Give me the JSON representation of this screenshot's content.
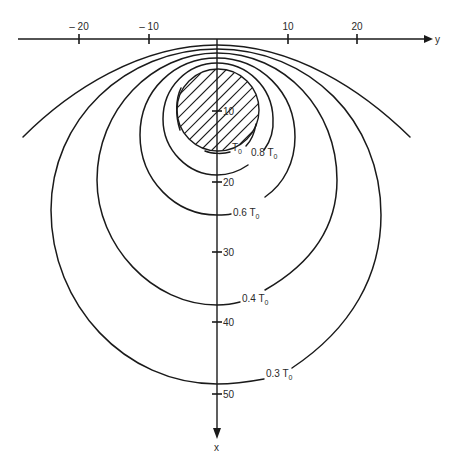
{
  "figure": {
    "stroke_color": "#1a1a1a",
    "background": "#ffffff"
  },
  "chart_data": {
    "type": "contour",
    "title": "",
    "xlabel": "x",
    "ylabel": "y",
    "y_axis_horizontal": {
      "name": "y",
      "ticks": [
        -20,
        -10,
        10,
        20
      ],
      "tick_labels": [
        "– 20",
        "– 10",
        "10",
        "20"
      ],
      "range": [
        -28,
        31
      ]
    },
    "x_axis_vertical": {
      "name": "x",
      "direction": "downward",
      "ticks": [
        10,
        20,
        30,
        40,
        50
      ],
      "tick_labels": [
        "10",
        "20",
        "30",
        "40",
        "50"
      ],
      "range": [
        0,
        58
      ]
    },
    "source": {
      "shape": "circle",
      "hatched": true,
      "center_x": 10,
      "center_y": 0,
      "radius": 6
    },
    "contours": [
      {
        "label": "T₀",
        "value": 1.0,
        "bottom_x": 6.2,
        "half_width": 6.1
      },
      {
        "label": "0.8 T₀",
        "value": 0.8,
        "bottom_x": 19.1,
        "half_width": 7.9
      },
      {
        "label": "0.6 T₀",
        "value": 0.6,
        "bottom_x": 24.8,
        "half_width": 11.0
      },
      {
        "label": "0.4 T₀",
        "value": 0.4,
        "bottom_x": 37.5,
        "half_width": 17.0
      },
      {
        "label": "0.3 T₀",
        "value": 0.3,
        "bottom_x": 48.9,
        "half_width": 23.5
      },
      {
        "label": "",
        "value": 0.2,
        "open": true,
        "endpoints_y": [
          -27.8,
          27.5
        ],
        "endpoints_x": 14
      }
    ]
  },
  "render": {
    "axes": {
      "h_line": {
        "x1": 18,
        "y1": 39,
        "x2": 428,
        "y2": 39
      },
      "h_arrow": "M 424 35 L 433 39 L 424 43 Z",
      "h_name_pos": [
        435,
        43
      ],
      "h_ticks": [
        {
          "x": 79,
          "label_x": 79,
          "label": "– 20"
        },
        {
          "x": 149,
          "label_x": 149,
          "label": "– 10"
        },
        {
          "x": 288,
          "label_x": 288,
          "label": "10"
        },
        {
          "x": 357,
          "label_x": 357,
          "label": "20"
        }
      ],
      "v_line": {
        "x1": 217,
        "y1": 39,
        "x2": 217,
        "y2": 432
      },
      "v_arrow": "M 213 428 L 217 439 L 221 428 Z",
      "v_name_pos": [
        214,
        451
      ],
      "v_ticks": [
        {
          "y": 111,
          "label": "10"
        },
        {
          "y": 182,
          "label": "20"
        },
        {
          "y": 252,
          "label": "30"
        },
        {
          "y": 322,
          "label": "40"
        },
        {
          "y": 394,
          "label": "50"
        }
      ]
    },
    "source_circle": {
      "cx": 218,
      "cy": 110,
      "r": 41
    },
    "contour_paths": [
      {
        "name": "contour-t0",
        "d": "M 181 88 C 176 98 175 115 180 130 M 256 124 C 254 136 250 142 246 146 M 230 152 C 224 154 212 154 205 151"
      },
      {
        "name": "contour-0-8",
        "d": "M 248 165 C 238 172 226 175 217 175 C 188 175 163 150 163 119 C 163 87 188 63 217 63 C 247 63 272 87 273 118 C 274 132 270 142 264 150"
      },
      {
        "name": "contour-0-6",
        "d": "M 231 214 C 227 215 222 215 217 215 C 175 215 140 180 140 135 C 140 90 175 58 217 58 C 260 58 295 92 295 137 C 295 162 284 184 265 197"
      },
      {
        "name": "contour-0-4",
        "d": "M 240 302 C 233 304 225 305 217 305 C 152 305 97 245 97 180 C 97 110 152 53 217 53 C 285 53 337 110 337 180 C 337 225 314 262 265 290"
      },
      {
        "name": "contour-0-3",
        "d": "M 264 379 C 248 382 232 384 217 384 C 125 384 51 305 51 210 C 51 120 125 49 217 49 C 309 49 381 120 381 215 C 381 275 352 328 292 368"
      },
      {
        "name": "contour-0-2-open",
        "d": "M 23 137 C 70 90 140 45 217 45 C 294 45 362 90 410 137"
      }
    ],
    "labels": [
      {
        "name": "label-t0",
        "x": 232,
        "y": 151,
        "text": "T",
        "sub": "0"
      },
      {
        "name": "label-0-8",
        "x": 251,
        "y": 156,
        "text": "0.8 T",
        "sub": "0"
      },
      {
        "name": "label-0-6",
        "x": 233,
        "y": 216,
        "text": "0.6 T",
        "sub": "0"
      },
      {
        "name": "label-0-4",
        "x": 242,
        "y": 302,
        "text": "0.4 T",
        "sub": "0"
      },
      {
        "name": "label-0-3",
        "x": 266,
        "y": 377,
        "text": "0.3 T",
        "sub": "0"
      }
    ]
  }
}
